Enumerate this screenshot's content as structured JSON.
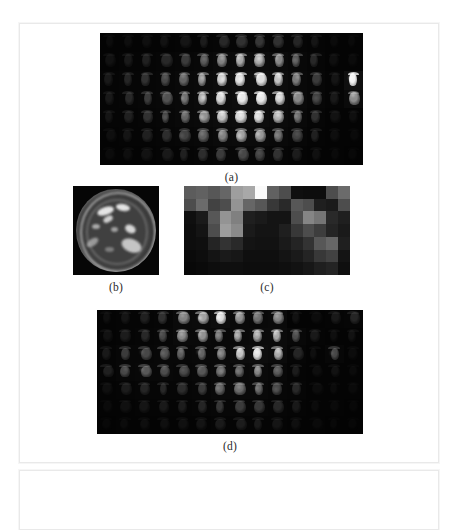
{
  "figure": {
    "panels": [
      {
        "id": "a",
        "caption": "(a)",
        "kind": "image-grid",
        "description": "grid of low-resolution grayscale face thumbnails on black background",
        "grid": {
          "columns": 14,
          "rows": 7
        },
        "background_color": "#040404"
      },
      {
        "id": "b",
        "caption": "(b)",
        "kind": "sphere-image",
        "description": "grayscale photograph of a reflective sphere with bright specular highlights",
        "background_color": "#060606"
      },
      {
        "id": "c",
        "caption": "(c)",
        "kind": "pixel-mosaic",
        "description": "heavily downsampled blocky grayscale image",
        "grid": {
          "columns": 14,
          "rows": 7
        },
        "background_color": "#050505"
      },
      {
        "id": "d",
        "caption": "(d)",
        "kind": "image-grid",
        "description": "grid of low-resolution grayscale face thumbnails on black background",
        "grid": {
          "columns": 14,
          "rows": 7
        },
        "background_color": "#040404"
      }
    ]
  },
  "chart_data": {
    "type": "heatmap",
    "title": "",
    "xlabel": "",
    "ylabel": "",
    "panels": [
      {
        "id": "a",
        "label": "(a)",
        "type": "heatmap",
        "rows": 7,
        "cols": 14,
        "note": "tile brightness 0-1 per thumbnail cell",
        "values": [
          [
            0.06,
            0.07,
            0.08,
            0.1,
            0.12,
            0.16,
            0.22,
            0.26,
            0.28,
            0.26,
            0.2,
            0.12,
            0.05,
            0.04
          ],
          [
            0.1,
            0.14,
            0.18,
            0.22,
            0.3,
            0.4,
            0.52,
            0.62,
            0.62,
            0.54,
            0.4,
            0.22,
            0.08,
            0.05
          ],
          [
            0.14,
            0.2,
            0.26,
            0.34,
            0.44,
            0.56,
            0.7,
            0.8,
            0.8,
            0.68,
            0.5,
            0.3,
            0.12,
            0.9
          ],
          [
            0.14,
            0.22,
            0.3,
            0.38,
            0.48,
            0.62,
            0.74,
            0.84,
            0.84,
            0.72,
            0.54,
            0.32,
            0.14,
            0.55
          ],
          [
            0.12,
            0.18,
            0.26,
            0.34,
            0.44,
            0.56,
            0.68,
            0.76,
            0.76,
            0.64,
            0.46,
            0.26,
            0.1,
            0.08
          ],
          [
            0.08,
            0.12,
            0.18,
            0.24,
            0.32,
            0.42,
            0.52,
            0.6,
            0.58,
            0.46,
            0.32,
            0.18,
            0.07,
            0.04
          ],
          [
            0.05,
            0.07,
            0.1,
            0.14,
            0.18,
            0.24,
            0.3,
            0.34,
            0.32,
            0.26,
            0.16,
            0.09,
            0.04,
            0.03
          ]
        ]
      },
      {
        "id": "c",
        "label": "(c)",
        "type": "heatmap",
        "rows": 7,
        "cols": 14,
        "note": "block luminance 0-1",
        "values": [
          [
            0.36,
            0.38,
            0.34,
            0.4,
            0.62,
            0.66,
            0.98,
            0.38,
            0.3,
            0.06,
            0.05,
            0.05,
            0.3,
            0.42
          ],
          [
            0.3,
            0.42,
            0.26,
            0.3,
            0.58,
            0.4,
            0.34,
            0.22,
            0.16,
            0.34,
            0.3,
            0.12,
            0.1,
            0.3
          ],
          [
            0.06,
            0.1,
            0.34,
            0.58,
            0.5,
            0.12,
            0.1,
            0.08,
            0.08,
            0.3,
            0.52,
            0.46,
            0.16,
            0.12
          ],
          [
            0.05,
            0.08,
            0.3,
            0.62,
            0.54,
            0.1,
            0.08,
            0.08,
            0.12,
            0.22,
            0.3,
            0.24,
            0.14,
            0.1
          ],
          [
            0.05,
            0.06,
            0.14,
            0.2,
            0.16,
            0.08,
            0.07,
            0.07,
            0.1,
            0.14,
            0.2,
            0.34,
            0.4,
            0.12
          ],
          [
            0.04,
            0.05,
            0.08,
            0.1,
            0.09,
            0.06,
            0.06,
            0.06,
            0.08,
            0.1,
            0.14,
            0.22,
            0.26,
            0.08
          ],
          [
            0.03,
            0.04,
            0.05,
            0.06,
            0.06,
            0.05,
            0.05,
            0.05,
            0.06,
            0.07,
            0.09,
            0.12,
            0.14,
            0.06
          ]
        ]
      },
      {
        "id": "d",
        "label": "(d)",
        "type": "heatmap",
        "rows": 7,
        "cols": 14,
        "note": "tile brightness 0-1 per thumbnail cell",
        "values": [
          [
            0.08,
            0.12,
            0.18,
            0.26,
            0.52,
            0.6,
            0.78,
            0.56,
            0.48,
            0.52,
            0.1,
            0.06,
            0.14,
            0.2
          ],
          [
            0.1,
            0.16,
            0.22,
            0.34,
            0.54,
            0.56,
            0.48,
            0.58,
            0.6,
            0.62,
            0.36,
            0.14,
            0.08,
            0.1
          ],
          [
            0.14,
            0.3,
            0.34,
            0.38,
            0.42,
            0.44,
            0.5,
            0.68,
            0.8,
            0.62,
            0.2,
            0.08,
            0.34,
            0.06
          ],
          [
            0.18,
            0.34,
            0.4,
            0.36,
            0.34,
            0.4,
            0.46,
            0.44,
            0.52,
            0.4,
            0.16,
            0.07,
            0.1,
            0.05
          ],
          [
            0.08,
            0.16,
            0.2,
            0.22,
            0.24,
            0.3,
            0.44,
            0.46,
            0.44,
            0.34,
            0.22,
            0.06,
            0.05,
            0.04
          ],
          [
            0.05,
            0.09,
            0.12,
            0.14,
            0.16,
            0.2,
            0.28,
            0.3,
            0.28,
            0.22,
            0.14,
            0.05,
            0.04,
            0.03
          ],
          [
            0.03,
            0.05,
            0.07,
            0.08,
            0.09,
            0.11,
            0.15,
            0.16,
            0.15,
            0.12,
            0.08,
            0.04,
            0.03,
            0.02
          ]
        ]
      }
    ]
  }
}
